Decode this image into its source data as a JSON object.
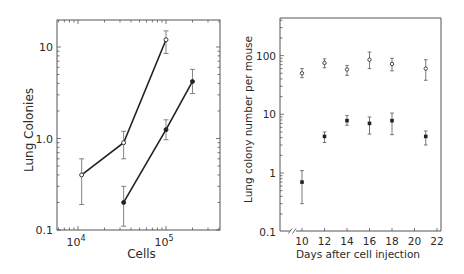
{
  "chart_data": [
    {
      "type": "line",
      "title": "",
      "xlabel": "Cells",
      "ylabel": "Lung Colonies",
      "xscale": "log",
      "yscale": "log",
      "xlim": [
        6000,
        400000
      ],
      "ylim": [
        0.1,
        20
      ],
      "xticks": [
        {
          "value": 10000,
          "label": "10^4"
        },
        {
          "value": 100000,
          "label": "10^5"
        }
      ],
      "yticks": [
        {
          "value": 0.1,
          "label": "0.1"
        },
        {
          "value": 1,
          "label": "1.0"
        },
        {
          "value": 10,
          "label": "10"
        }
      ],
      "grid": false,
      "series": [
        {
          "name": "open circles",
          "marker": "open-circle",
          "x": [
            11000,
            33000,
            100000
          ],
          "y": [
            0.4,
            0.9,
            12
          ],
          "err_low": [
            0.19,
            0.6,
            8.5
          ],
          "err_high": [
            0.6,
            1.2,
            15
          ]
        },
        {
          "name": "filled circles",
          "marker": "filled-circle",
          "x": [
            33000,
            100000,
            200000
          ],
          "y": [
            0.2,
            1.25,
            4.2
          ],
          "err_low": [
            0.11,
            0.97,
            3.1
          ],
          "err_high": [
            0.3,
            1.6,
            5.7
          ]
        }
      ]
    },
    {
      "type": "scatter",
      "title": "",
      "xlabel": "Days after cell injection",
      "ylabel": "Lung colony number per mouse",
      "xscale": "linear",
      "yscale": "log",
      "xlim": [
        8,
        22
      ],
      "ylim": [
        0.1,
        400
      ],
      "xticks": [
        {
          "value": 10,
          "label": "10"
        },
        {
          "value": 12,
          "label": "12"
        },
        {
          "value": 14,
          "label": "14"
        },
        {
          "value": 16,
          "label": "16"
        },
        {
          "value": 18,
          "label": "18"
        },
        {
          "value": 20,
          "label": "20"
        },
        {
          "value": 22,
          "label": "22"
        }
      ],
      "yticks": [
        {
          "value": 0.1,
          "label": "0.1"
        },
        {
          "value": 1,
          "label": "1"
        },
        {
          "value": 10,
          "label": "10"
        },
        {
          "value": 100,
          "label": "100"
        }
      ],
      "axis_break": "//",
      "grid": false,
      "series": [
        {
          "name": "open circles",
          "marker": "open-circle",
          "x": [
            10,
            12,
            14,
            16,
            18,
            21
          ],
          "y": [
            50,
            75,
            58,
            85,
            72,
            60
          ],
          "err_low": [
            42,
            62,
            46,
            60,
            55,
            38
          ],
          "err_high": [
            60,
            88,
            68,
            115,
            90,
            85
          ]
        },
        {
          "name": "filled circles",
          "marker": "filled-circle",
          "x": [
            10,
            12,
            14,
            16,
            18,
            21
          ],
          "y": [
            0.7,
            4.2,
            7.8,
            7.0,
            7.8,
            4.2
          ],
          "err_low": [
            0.3,
            3.3,
            6.5,
            4.6,
            4.5,
            3.0
          ],
          "err_high": [
            1.1,
            5.0,
            9.5,
            9.0,
            10.5,
            5.2
          ]
        }
      ]
    }
  ]
}
